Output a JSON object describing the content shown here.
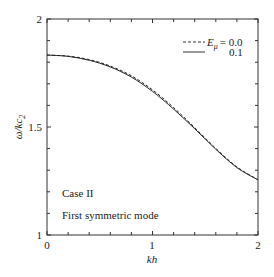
{
  "chart_data": {
    "type": "line",
    "title": "",
    "xlabel": "kh",
    "ylabel": "ω/kc₂",
    "xlim": [
      0,
      2
    ],
    "ylim": [
      1,
      2
    ],
    "x_ticks": [
      "0",
      "1",
      "2"
    ],
    "y_ticks": [
      "1",
      "1.5",
      "2"
    ],
    "grid": false,
    "legend": {
      "position": "upper right",
      "title_symbol": "E_μ",
      "entries": [
        {
          "label": "E_μ = 0.0",
          "value": "0.0",
          "style": "dashed"
        },
        {
          "label": "0.1",
          "value": "0.1",
          "style": "solid"
        }
      ]
    },
    "annotations": [
      "Case II",
      "First symmetric mode"
    ],
    "x": [
      0,
      0.2,
      0.4,
      0.6,
      0.8,
      1.0,
      1.2,
      1.4,
      1.6,
      1.8,
      2.0
    ],
    "series": [
      {
        "name": "E_μ = 0.0",
        "style": "dashed",
        "values": [
          1.833,
          1.828,
          1.812,
          1.782,
          1.737,
          1.672,
          1.59,
          1.497,
          1.401,
          1.315,
          1.256
        ]
      },
      {
        "name": "E_μ = 0.1",
        "style": "solid",
        "values": [
          1.833,
          1.827,
          1.809,
          1.778,
          1.731,
          1.665,
          1.583,
          1.492,
          1.397,
          1.312,
          1.255
        ]
      }
    ]
  },
  "labels": {
    "xlabel": "kh",
    "ylabel_main": "ω/kc",
    "ylabel_sub": "2",
    "legend_symbol": "E",
    "legend_symbol_sub": "μ",
    "legend_first": "= 0.0",
    "legend_second": "0.1",
    "annotation_1": "Case II",
    "annotation_2": "First symmetric mode",
    "x_tick_0": "0",
    "x_tick_1": "1",
    "x_tick_2": "2",
    "y_tick_1": "1",
    "y_tick_15": "1.5",
    "y_tick_2": "2"
  }
}
